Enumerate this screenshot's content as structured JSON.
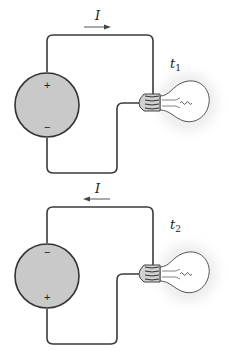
{
  "figure": {
    "colors": {
      "wire": "#3a3a3a",
      "battery_fill": "#c9c9c9",
      "battery_stroke": "#333333",
      "glow": "#e6e6e6",
      "bulb_glass": "#ffffff",
      "socket": "#bdbdbd"
    },
    "panels": [
      {
        "id": "top",
        "current_label": "I",
        "current_direction": "right",
        "time_label": "t",
        "time_subscript": "1",
        "battery_top_sign": "+",
        "battery_bottom_sign": "−"
      },
      {
        "id": "bottom",
        "current_label": "I",
        "current_direction": "left",
        "time_label": "t",
        "time_subscript": "2",
        "battery_top_sign": "−",
        "battery_bottom_sign": "+"
      }
    ]
  }
}
